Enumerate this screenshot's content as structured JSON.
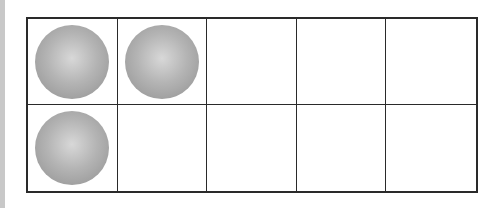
{
  "ten_frame": {
    "rows": 2,
    "columns": 5,
    "filled_count": 3,
    "cells": [
      {
        "row": 1,
        "col": 1,
        "filled": true
      },
      {
        "row": 1,
        "col": 2,
        "filled": true
      },
      {
        "row": 1,
        "col": 3,
        "filled": false
      },
      {
        "row": 1,
        "col": 4,
        "filled": false
      },
      {
        "row": 1,
        "col": 5,
        "filled": false
      },
      {
        "row": 2,
        "col": 1,
        "filled": true
      },
      {
        "row": 2,
        "col": 2,
        "filled": false
      },
      {
        "row": 2,
        "col": 3,
        "filled": false
      },
      {
        "row": 2,
        "col": 4,
        "filled": false
      },
      {
        "row": 2,
        "col": 5,
        "filled": false
      }
    ],
    "colors": {
      "grid_line": "#2a2a2a",
      "counter": "#a8a8a8",
      "background": "#ffffff"
    }
  }
}
